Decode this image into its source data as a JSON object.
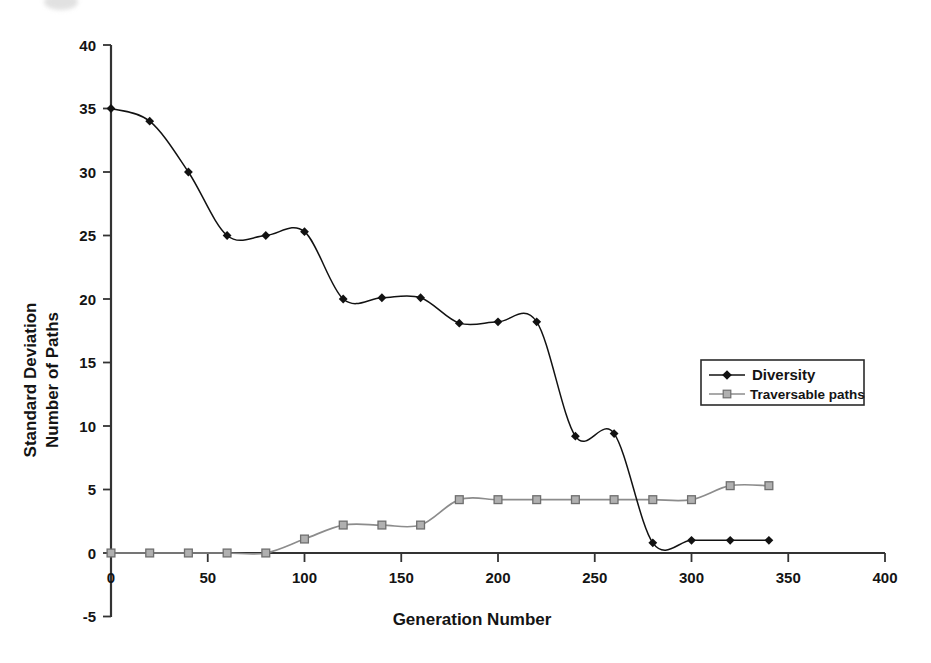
{
  "chart_data": {
    "type": "line",
    "title": "",
    "xlabel": "Generation Number",
    "ylabel": "Standard Deviation Number of Paths",
    "ylabel_lines": [
      "Standard Deviation",
      "Number of Paths"
    ],
    "xlim": [
      0,
      400
    ],
    "ylim": [
      -5,
      40
    ],
    "xticks": [
      0,
      50,
      100,
      150,
      200,
      250,
      300,
      350,
      400
    ],
    "xtick_labels": [
      "0",
      "50",
      "100",
      "150",
      "200",
      "250",
      "300",
      "350",
      "400"
    ],
    "yticks": [
      -5,
      0,
      5,
      10,
      15,
      20,
      25,
      30,
      35,
      40
    ],
    "ytick_labels": [
      "-5",
      "0",
      "5",
      "10",
      "15",
      "20",
      "25",
      "30",
      "35",
      "40"
    ],
    "grid": false,
    "legend_position": "right-middle",
    "x": [
      0,
      20,
      40,
      60,
      80,
      100,
      120,
      140,
      160,
      180,
      200,
      220,
      240,
      260,
      280,
      300,
      320,
      340
    ],
    "series": [
      {
        "name": "Diversity",
        "marker": "diamond",
        "color": "#121212",
        "values": [
          35.0,
          34.0,
          30.0,
          25.0,
          25.0,
          25.3,
          20.0,
          20.1,
          20.1,
          18.1,
          18.2,
          18.2,
          9.2,
          9.4,
          0.8,
          1.0,
          1.0,
          1.0
        ]
      },
      {
        "name": "Traversable paths",
        "marker": "square",
        "color": "#8c8c8c",
        "values": [
          0.0,
          0.0,
          0.0,
          0.0,
          0.0,
          1.1,
          2.2,
          2.2,
          2.2,
          4.2,
          4.2,
          4.2,
          4.2,
          4.2,
          4.2,
          4.2,
          5.3,
          5.3
        ]
      }
    ],
    "colors": {
      "diversity": "#121212",
      "traversable_paths": "#8c8c8c",
      "axis": "#333333",
      "background": "#ffffff"
    }
  },
  "legend": {
    "entries": [
      {
        "label": "Diversity",
        "marker": "diamond-marker",
        "color": "#121212"
      },
      {
        "label": "Traversable paths",
        "marker": "square-marker",
        "color": "#8c8c8c"
      }
    ]
  }
}
